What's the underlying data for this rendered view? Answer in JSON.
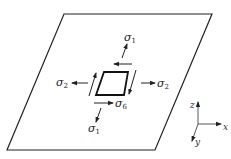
{
  "figure": {
    "plate": {
      "corners": [
        [
          64,
          14
        ],
        [
          212,
          14
        ],
        [
          155,
          150
        ],
        [
          7,
          150
        ]
      ]
    },
    "element": {
      "corners": [
        [
          104,
          72
        ],
        [
          128,
          72
        ],
        [
          124,
          95
        ],
        [
          96,
          95
        ]
      ]
    },
    "labels": {
      "sigma1_top": {
        "base": "σ",
        "sub": "1"
      },
      "sigma1_bottom": {
        "base": "σ",
        "sub": "1"
      },
      "sigma2_left": {
        "base": "σ",
        "sub": "2"
      },
      "sigma2_right": {
        "base": "σ",
        "sub": "2"
      },
      "sigma6": {
        "base": "σ",
        "sub": "6"
      }
    },
    "axes": {
      "x": "x",
      "y": "y",
      "z": "z"
    },
    "colors": {
      "line": "#222222",
      "background": "#ffffff"
    }
  }
}
